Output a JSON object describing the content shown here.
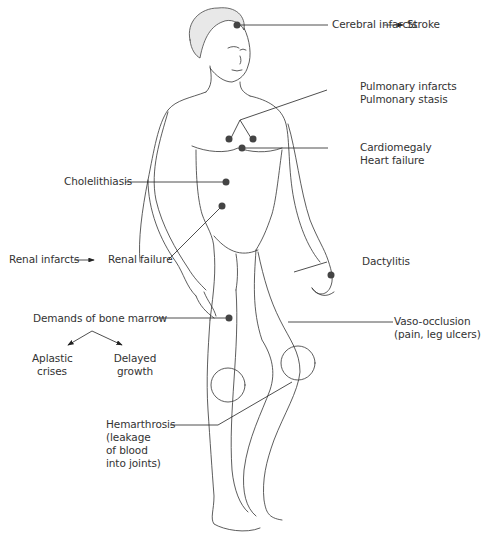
{
  "diagram": {
    "type": "anatomical-callout-illustration",
    "colors": {
      "line": "#222222",
      "dot": "#444444",
      "text": "#333333",
      "background": "#ffffff"
    },
    "labels": {
      "cerebral": "Cerebral infarcts",
      "stroke": "Stroke",
      "pulmonary1": "Pulmonary infarcts",
      "pulmonary2": "Pulmonary stasis",
      "cardio1": "Cardiomegaly",
      "cardio2": "Heart failure",
      "chole": "Cholelithiasis",
      "renal_infarcts": "Renal infarcts",
      "renal_failure": "Renal failure",
      "dactylitis": "Dactylitis",
      "bone_marrow": "Demands of bone marrow",
      "aplastic1": "Aplastic",
      "aplastic2": "crises",
      "delayed1": "Delayed",
      "delayed2": "growth",
      "vaso1": "Vaso-occlusion",
      "vaso2": "(pain, leg ulcers)",
      "hem1": "Hemarthrosis",
      "hem2": "(leakage",
      "hem3": "of blood",
      "hem4": "into joints)"
    },
    "relationships": [
      {
        "from": "Cerebral infarcts",
        "to": "Stroke"
      },
      {
        "from": "Renal infarcts",
        "to": "Renal failure"
      },
      {
        "from": "Demands of bone marrow",
        "to": [
          "Aplastic crises",
          "Delayed growth"
        ]
      }
    ]
  }
}
